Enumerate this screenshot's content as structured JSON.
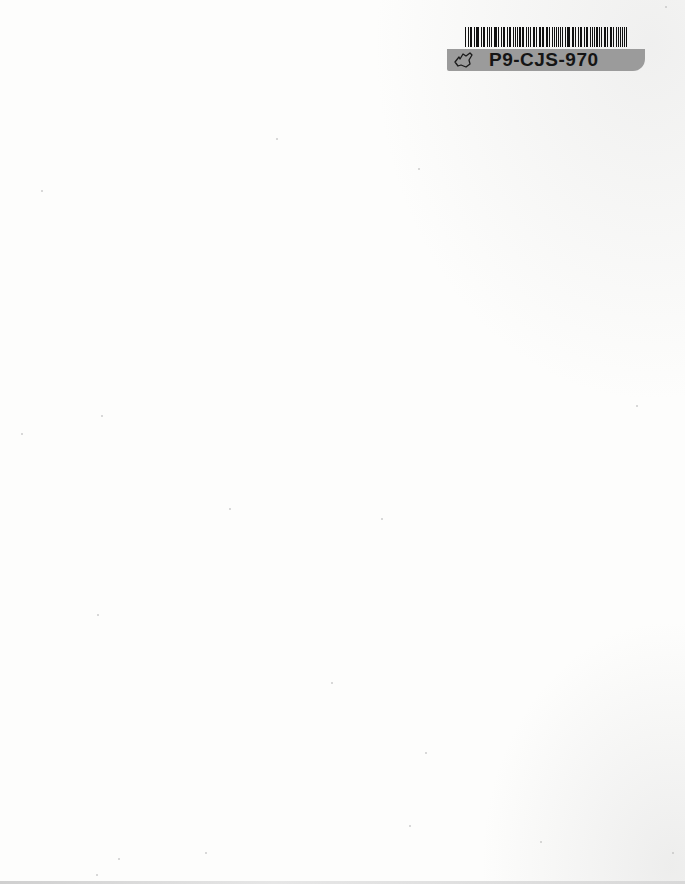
{
  "document": {
    "type": "scanned blank page",
    "background_color": "#fdfdfc"
  },
  "label": {
    "code": "P9-CJS-970",
    "icon": "state-outline-icon",
    "band_color": "#9b9b9b",
    "text_color": "#151515",
    "barcode_bars": [
      2,
      1,
      1,
      2,
      1,
      1,
      3,
      1,
      1,
      2,
      2,
      1,
      1,
      1,
      3,
      2,
      1,
      1,
      2,
      1,
      1,
      2,
      1,
      1,
      1,
      3,
      1,
      1,
      2,
      2,
      1,
      1,
      1,
      2,
      3,
      1,
      1,
      1,
      2,
      1,
      2,
      1,
      1,
      1,
      2,
      2,
      1,
      1,
      3,
      1,
      1,
      2,
      1,
      1,
      2,
      1,
      1,
      2,
      1,
      1,
      1,
      3,
      2,
      1,
      1,
      1,
      2,
      1,
      1,
      2,
      1,
      2,
      1,
      1,
      3,
      1
    ]
  }
}
